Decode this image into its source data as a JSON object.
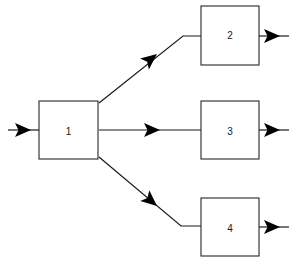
{
  "diagram": {
    "type": "block-flow-diagram",
    "background_color": "#ffffff",
    "line_color": "#1a1a1a",
    "box_border_color": "#262626",
    "box_fill_color": "#ffffff",
    "blocks": [
      {
        "id": "block-1",
        "label": "1",
        "x": 39,
        "y": 101,
        "width": 59,
        "height": 58
      },
      {
        "id": "block-2",
        "label": "2",
        "x": 201,
        "y": 6,
        "width": 58,
        "height": 59
      },
      {
        "id": "block-3",
        "label": "3",
        "x": 201,
        "y": 101,
        "width": 58,
        "height": 58
      },
      {
        "id": "block-4",
        "label": "4",
        "x": 201,
        "y": 198,
        "width": 58,
        "height": 58
      }
    ],
    "connections": [
      {
        "id": "input-arrow",
        "from": "external-input",
        "to": "block-1",
        "style": "horizontal"
      },
      {
        "id": "branch-to-block-2",
        "from": "block-1",
        "to": "block-2",
        "style": "diagonal-up-then-horizontal"
      },
      {
        "id": "branch-to-block-3",
        "from": "block-1",
        "to": "block-3",
        "style": "horizontal"
      },
      {
        "id": "branch-to-block-4",
        "from": "block-1",
        "to": "block-4",
        "style": "diagonal-down-then-horizontal"
      },
      {
        "id": "output-arrow-block-2",
        "from": "block-2",
        "to": "external-output",
        "style": "horizontal"
      },
      {
        "id": "output-arrow-block-3",
        "from": "block-3",
        "to": "external-output",
        "style": "horizontal"
      },
      {
        "id": "output-arrow-block-4",
        "from": "block-4",
        "to": "external-output",
        "style": "horizontal"
      }
    ]
  }
}
